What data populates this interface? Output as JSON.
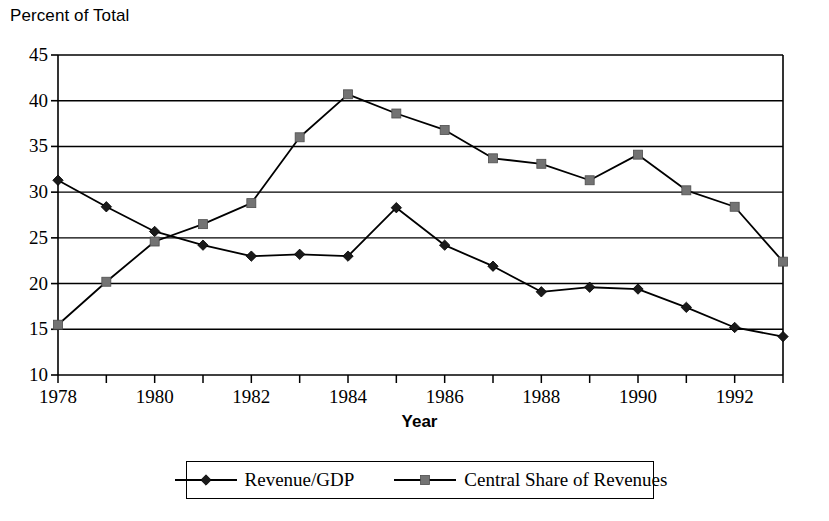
{
  "chart_data": {
    "type": "line",
    "title": "",
    "ylabel": "Percent of Total",
    "xlabel": "Year",
    "ylim": [
      10,
      45
    ],
    "ytick_step": 5,
    "yticks": [
      10,
      15,
      20,
      25,
      30,
      35,
      40,
      45
    ],
    "grid": true,
    "grid_axis": "y",
    "legend_position": "bottom",
    "x": [
      1978,
      1979,
      1980,
      1981,
      1982,
      1983,
      1984,
      1985,
      1986,
      1987,
      1988,
      1989,
      1990,
      1991,
      1992,
      1993
    ],
    "xticks": [
      1978,
      1980,
      1982,
      1984,
      1986,
      1988,
      1990,
      1992
    ],
    "xticklabels": [
      "1978",
      "1980",
      "1982",
      "1984",
      "1986",
      "1988",
      "1990",
      "1992"
    ],
    "series": [
      {
        "name": "Revenue/GDP",
        "marker": "diamond",
        "color": "#000000",
        "values": [
          31.3,
          28.4,
          25.7,
          24.2,
          23.0,
          23.2,
          23.0,
          28.3,
          24.2,
          21.9,
          19.1,
          19.6,
          19.4,
          17.4,
          15.2,
          14.2
        ]
      },
      {
        "name": "Central Share of Revenues",
        "marker": "square",
        "color": "#595959",
        "values": [
          15.5,
          20.2,
          24.6,
          26.5,
          28.8,
          36.0,
          40.7,
          38.6,
          36.8,
          33.7,
          33.1,
          31.3,
          34.1,
          30.2,
          28.4,
          22.4
        ]
      }
    ]
  },
  "legend": {
    "items": [
      {
        "label": "Revenue/GDP",
        "marker": "diamond"
      },
      {
        "label": "Central Share of Revenues",
        "marker": "square"
      }
    ]
  },
  "axis": {
    "y_title": "Percent of Total",
    "x_title": "Year"
  },
  "colors": {
    "line": "#000000",
    "marker_series1": "#1a1a1a",
    "marker_series2": "#737373",
    "grid": "#000000",
    "axis": "#000000",
    "background": "#ffffff"
  }
}
